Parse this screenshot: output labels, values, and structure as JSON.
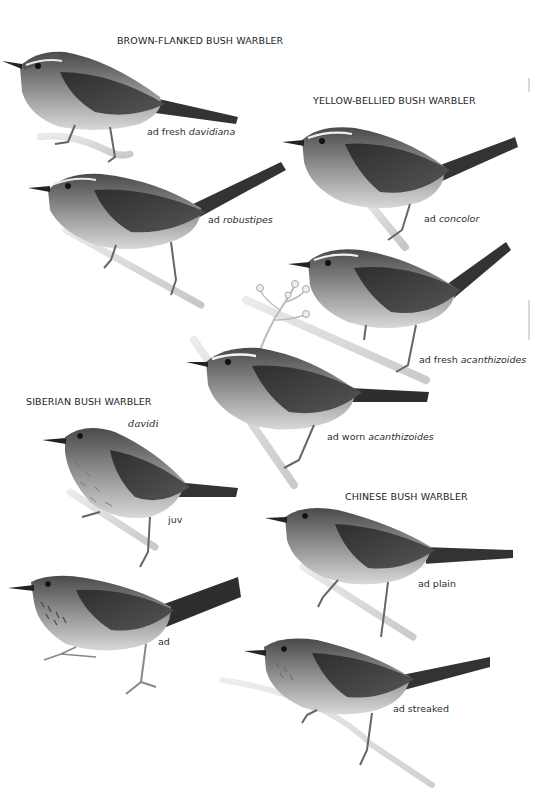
{
  "plate": {
    "species": [
      {
        "name": "BROWN-FLANKED BUSH WARBLER",
        "figures": [
          {
            "caption_prefix": "ad fresh",
            "caption_italic": "davidiana"
          },
          {
            "caption_prefix": "ad",
            "caption_italic": "robustipes"
          }
        ]
      },
      {
        "name": "YELLOW-BELLIED BUSH WARBLER",
        "figures": [
          {
            "caption_prefix": "ad",
            "caption_italic": "concolor"
          },
          {
            "caption_prefix": "ad fresh",
            "caption_italic": "acanthizoides"
          },
          {
            "caption_prefix": "ad worn",
            "caption_italic": "acanthizoides"
          }
        ]
      },
      {
        "name": "SIBERIAN BUSH WARBLER",
        "subspecies_label": "davidi",
        "figures": [
          {
            "caption_prefix": "juv",
            "caption_italic": ""
          },
          {
            "caption_prefix": "ad",
            "caption_italic": ""
          }
        ]
      },
      {
        "name": "CHINESE BUSH WARBLER",
        "figures": [
          {
            "caption_prefix": "ad plain",
            "caption_italic": ""
          },
          {
            "caption_prefix": "ad streaked",
            "caption_italic": ""
          }
        ]
      }
    ]
  },
  "colors": {
    "background": "#ffffff",
    "text": "#2a2a2a",
    "bird_dark": "#3a3a3a",
    "bird_mid": "#6e6e6e",
    "bird_light": "#d8d8d8"
  }
}
